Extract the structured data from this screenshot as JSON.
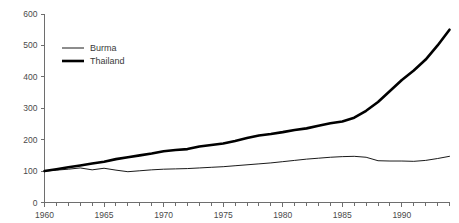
{
  "chart_data": {
    "type": "line",
    "title": "",
    "subtitle": "",
    "xlabel": "",
    "ylabel": "",
    "xlim": [
      1960,
      1994
    ],
    "ylim": [
      0,
      600
    ],
    "grid": false,
    "legend_position": "top-left",
    "y_ticks": [
      0,
      100,
      200,
      300,
      400,
      500,
      600
    ],
    "y_tick_labels": [
      "0",
      "100",
      "200",
      "300",
      "400",
      "500",
      "600"
    ],
    "x_ticks": [
      1960,
      1965,
      1970,
      1975,
      1980,
      1985,
      1990
    ],
    "x_tick_labels": [
      "1960",
      "1965",
      "1970",
      "1975",
      "1980",
      "1985",
      "1990"
    ],
    "x_minor_step": 1,
    "x": [
      1960,
      1961,
      1962,
      1963,
      1964,
      1965,
      1966,
      1967,
      1968,
      1969,
      1970,
      1971,
      1972,
      1973,
      1974,
      1975,
      1976,
      1977,
      1978,
      1979,
      1980,
      1981,
      1982,
      1983,
      1984,
      1985,
      1986,
      1987,
      1988,
      1989,
      1990,
      1991,
      1992,
      1993,
      1994
    ],
    "series": [
      {
        "name": "Burma",
        "color": "#000000",
        "width": 0.9,
        "values": [
          100,
          103,
          106,
          110,
          104,
          109,
          103,
          98,
          101,
          104,
          106,
          107,
          108,
          110,
          112,
          114,
          117,
          120,
          123,
          126,
          130,
          134,
          138,
          141,
          144,
          146,
          147,
          144,
          133,
          132,
          132,
          131,
          134,
          140,
          147
        ]
      },
      {
        "name": "Thailand",
        "color": "#000000",
        "width": 2.6,
        "values": [
          100,
          106,
          112,
          118,
          124,
          130,
          138,
          144,
          150,
          156,
          163,
          167,
          170,
          178,
          183,
          188,
          196,
          205,
          213,
          218,
          224,
          231,
          236,
          244,
          252,
          258,
          270,
          292,
          320,
          355,
          390,
          420,
          455,
          500,
          550
        ]
      }
    ],
    "legend": [
      {
        "label": "Burma",
        "color": "#000000",
        "width": 0.9
      },
      {
        "label": "Thailand",
        "color": "#000000",
        "width": 2.6
      }
    ]
  }
}
